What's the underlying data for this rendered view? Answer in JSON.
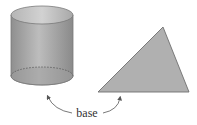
{
  "diagram": {
    "label": "base",
    "shapes": [
      {
        "name": "cylinder",
        "fill": "#a9a9a9",
        "stroke": "#7a7a7a"
      },
      {
        "name": "triangle",
        "fill": "#b0b0b0",
        "stroke": "#6f6f6f"
      }
    ],
    "colors": {
      "cylinder_light": "#c4c4c4",
      "cylinder_dark": "#8e8e8e",
      "arrow": "#555555",
      "text": "#333333"
    }
  }
}
